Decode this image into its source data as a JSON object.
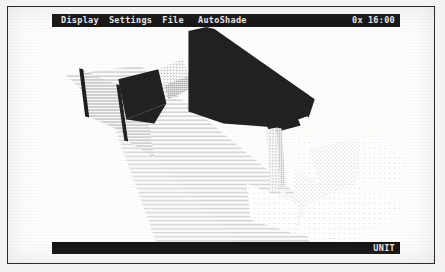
{
  "app": {
    "title": "AutoShade",
    "screen_width": 445,
    "screen_height": 272
  },
  "menubar": {
    "items": [
      {
        "label": "Display",
        "name": "menu-display"
      },
      {
        "label": "Settings",
        "name": "menu-settings"
      },
      {
        "label": "File",
        "name": "menu-file"
      }
    ],
    "center_title": "AutoShade",
    "right_status": {
      "zoom": "0x",
      "time": "16:00"
    }
  },
  "statusbar": {
    "right_label": "UNIT"
  },
  "scene": {
    "background": "#fdfdfc",
    "ink": "#1d1d1d",
    "colors": {
      "dark_face": "#2b2b2b",
      "mid_dark_face": "#3a3a3a",
      "mid_face": "#8e8e8e",
      "light_face": "#cfcfcf",
      "pale_face": "#e6e6e6",
      "faint_face": "#f1f1f1",
      "shadow_plane": "#dddddd"
    },
    "objects": [
      {
        "name": "dark-roof-slab",
        "shade": "dark"
      },
      {
        "name": "dark-gable-triangle",
        "shade": "dark"
      },
      {
        "name": "dark-left-wedge",
        "shade": "dark"
      },
      {
        "name": "left-wall-panel",
        "shade": "mid"
      },
      {
        "name": "ground-shadow-band",
        "shade": "light"
      },
      {
        "name": "lower-right-facets",
        "shade": "faint"
      },
      {
        "name": "spire-column",
        "shade": "light"
      }
    ]
  }
}
